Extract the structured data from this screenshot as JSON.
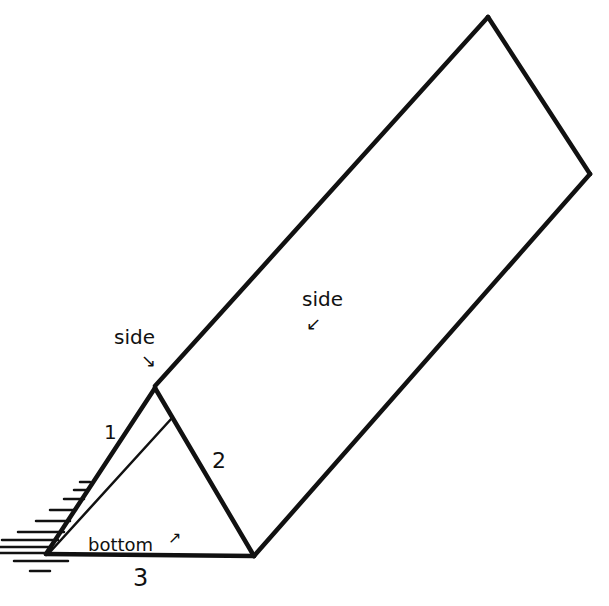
{
  "diagram": {
    "colors": {
      "ink": "#111111",
      "paper": "#ffffff"
    },
    "labels": {
      "side_left": "side",
      "side_right": "side",
      "bottom": "bottom",
      "edge_1": "1",
      "edge_2": "2",
      "edge_3": "3"
    },
    "arrows": {
      "side_left": "↘",
      "side_right": "↙",
      "bottom": "↗"
    }
  }
}
